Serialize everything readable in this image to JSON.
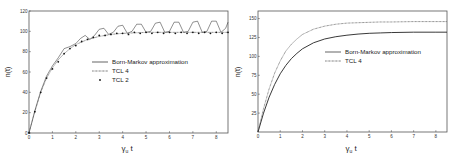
{
  "chart_data": [
    {
      "type": "line",
      "title": "",
      "xlabel": "γ_u t",
      "ylabel": "n(t)",
      "xlim": [
        0,
        8.5
      ],
      "ylim": [
        0,
        120
      ],
      "x_ticks": [
        "0",
        "1",
        "2",
        "3",
        "4",
        "5",
        "6",
        "7",
        "8"
      ],
      "y_ticks": [
        "0",
        "20",
        "40",
        "60",
        "80",
        "100",
        "120"
      ],
      "grid": false,
      "legend_position": "center-right",
      "series": [
        {
          "name": "Born-Markov approximation",
          "style": "solid",
          "x": [
            0,
            0.25,
            0.5,
            0.75,
            1.0,
            1.25,
            1.5,
            1.75,
            2.0,
            2.2,
            2.4,
            2.6,
            2.8,
            3.0,
            3.2,
            3.4,
            3.6,
            3.8,
            4.0,
            4.2,
            4.4,
            4.6,
            4.8,
            5.0,
            5.2,
            5.4,
            5.6,
            5.8,
            6.0,
            6.2,
            6.4,
            6.6,
            6.8,
            7.0,
            7.2,
            7.4,
            7.6,
            7.8,
            8.0,
            8.2,
            8.4,
            8.5
          ],
          "values": [
            0,
            22,
            41,
            56,
            66,
            74,
            83,
            85,
            88,
            93,
            96,
            92,
            96,
            102,
            103,
            97,
            99,
            105,
            106,
            98,
            100,
            107,
            107,
            99,
            100,
            108,
            109,
            99,
            100,
            109,
            109,
            99,
            100,
            109,
            110,
            99,
            100,
            110,
            110,
            99,
            103,
            109
          ]
        },
        {
          "name": "TCL 4",
          "style": "dotted",
          "x": [
            0,
            0.25,
            0.5,
            0.75,
            1.0,
            1.25,
            1.5,
            1.75,
            2.0,
            2.5,
            3.0,
            3.5,
            4.0,
            4.5,
            5.0,
            5.5,
            6.0,
            6.5,
            7.0,
            7.5,
            8.0,
            8.5
          ],
          "values": [
            0,
            21,
            40,
            54,
            64,
            72,
            78,
            83,
            87,
            92,
            95,
            97,
            98,
            98.5,
            99,
            99,
            99,
            99,
            99,
            99,
            99,
            99
          ]
        },
        {
          "name": "TCL 2",
          "style": "points",
          "x": [
            0,
            0.25,
            0.5,
            0.75,
            1.0,
            1.25,
            1.5,
            1.75,
            2.0,
            2.25,
            2.5,
            2.75,
            3.0,
            3.25,
            3.5,
            3.75,
            4.0,
            4.25,
            4.5,
            4.75,
            5.0,
            5.25,
            5.5,
            5.75,
            6.0,
            6.25,
            6.5,
            6.75,
            7.0,
            7.25,
            7.5,
            7.75,
            8.0,
            8.25,
            8.5
          ],
          "values": [
            0,
            21,
            40,
            54,
            63,
            70,
            78,
            83,
            86,
            90,
            92,
            94,
            96,
            96,
            97,
            98,
            98,
            97,
            99,
            98,
            99,
            98,
            99,
            98,
            99,
            98,
            99,
            98,
            99,
            98,
            99,
            98,
            99,
            98,
            99
          ]
        }
      ]
    },
    {
      "type": "line",
      "title": "",
      "xlabel": "γ_u t",
      "ylabel": "n(t)",
      "xlim": [
        0,
        8.5
      ],
      "ylim": [
        0,
        160
      ],
      "x_ticks": [
        "0",
        "1",
        "2",
        "3",
        "4",
        "5",
        "6",
        "7",
        "8"
      ],
      "y_ticks": [
        "25",
        "50",
        "75",
        "100",
        "125",
        "150"
      ],
      "grid": false,
      "legend_position": "center-right",
      "series": [
        {
          "name": "Born-Markov approximation",
          "style": "solid",
          "x": [
            0,
            0.25,
            0.5,
            0.75,
            1.0,
            1.25,
            1.5,
            1.75,
            2.0,
            2.5,
            3.0,
            3.5,
            4.0,
            4.5,
            5.0,
            5.5,
            6.0,
            7.0,
            8.0,
            8.5
          ],
          "values": [
            0,
            25,
            46,
            63,
            77,
            88,
            97,
            104,
            110,
            118,
            123,
            126,
            128,
            129.5,
            130.5,
            131,
            131.5,
            132,
            132,
            132
          ]
        },
        {
          "name": "TCL 4",
          "style": "dotted",
          "x": [
            0,
            0.25,
            0.5,
            0.75,
            1.0,
            1.25,
            1.5,
            1.75,
            2.0,
            2.5,
            3.0,
            3.5,
            4.0,
            4.5,
            5.0,
            5.5,
            6.0,
            7.0,
            8.0,
            8.5
          ],
          "values": [
            0,
            31,
            57,
            78,
            94,
            107,
            116,
            123,
            129,
            136,
            140,
            142.5,
            144,
            144.5,
            145,
            145.5,
            145.5,
            146,
            146,
            146
          ]
        }
      ]
    }
  ]
}
